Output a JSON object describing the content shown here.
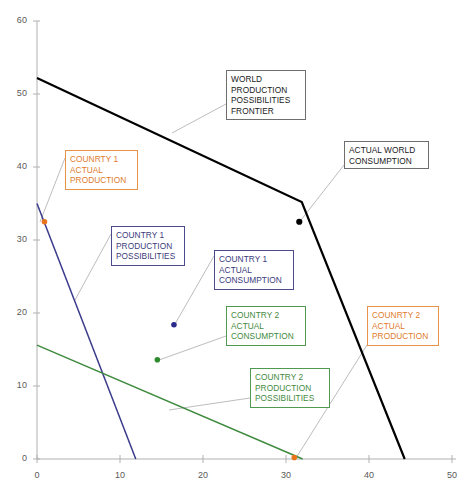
{
  "chart_data": {
    "type": "line",
    "title": "",
    "xlabel": "",
    "ylabel": "",
    "xlim": [
      0,
      50
    ],
    "ylim": [
      0,
      60
    ],
    "xticks": [
      0,
      10,
      20,
      30,
      40,
      50
    ],
    "yticks": [
      0,
      10,
      20,
      30,
      40,
      50,
      60
    ],
    "grid": false,
    "legend": "none (in-plot annotation boxes with leader lines)",
    "series": [
      {
        "name": "WORLD PRODUCTION POSSIBILITIES FRONTIER",
        "type": "line",
        "color": "#000000",
        "width": 2.2,
        "points": [
          [
            0,
            52.2
          ],
          [
            31.9,
            35.2
          ],
          [
            44.3,
            0
          ]
        ]
      },
      {
        "name": "COUNTRY 1 PRODUCTION POSSIBILITIES",
        "type": "line",
        "color": "#3b3b8c",
        "width": 1.5,
        "points": [
          [
            0,
            35.0
          ],
          [
            11.9,
            0
          ]
        ]
      },
      {
        "name": "COUNTRY 2 PRODUCTION POSSIBILITIES",
        "type": "line",
        "color": "#3f8a3f",
        "width": 1.5,
        "points": [
          [
            0,
            15.6
          ],
          [
            32.0,
            0
          ]
        ]
      }
    ],
    "points": [
      {
        "name": "ACTUAL WORLD CONSUMPTION",
        "x": 31.6,
        "y": 32.5,
        "color": "#000000",
        "r": 3.1
      },
      {
        "name": "COUNRTY 1 ACTUAL PRODUCTION",
        "x": 0.9,
        "y": 32.5,
        "color": "#e8751a",
        "r": 2.8
      },
      {
        "name": "COUNTRY 1 ACTUAL CONSUMPTION",
        "x": 16.5,
        "y": 18.4,
        "color": "#2b2b8f",
        "r": 2.8
      },
      {
        "name": "COUNTRY 2 ACTUAL CONSUMPTION",
        "x": 14.5,
        "y": 13.6,
        "color": "#2e8b2e",
        "r": 2.8
      },
      {
        "name": "COUNRTY 2 ACTUAL PRODUCTION",
        "x": 31.0,
        "y": 0.2,
        "color": "#e8751a",
        "r": 2.8
      }
    ],
    "annotations": [
      {
        "id": "world-ppf",
        "text": "WORLD\nPRODUCTION\nPOSSIBILITIES\nFRONTIER",
        "style": "black",
        "box_px": {
          "left": 226,
          "top": 70,
          "width": 80,
          "height": 50
        },
        "leader_px": [
          [
            226,
            104
          ],
          [
            172,
            133
          ]
        ]
      },
      {
        "id": "actual-world-consumption",
        "text": "ACTUAL WORLD\nCONSUMPTION",
        "style": "black",
        "box_px": {
          "left": 344,
          "top": 141,
          "width": 85,
          "height": 28
        },
        "leader_px": [
          [
            344,
            165
          ],
          [
            301,
            220
          ]
        ]
      },
      {
        "id": "country1-actual-production",
        "text": "COUNRTY 1\nACTUAL\nPRODUCTION",
        "style": "orange",
        "box_px": {
          "left": 65,
          "top": 150,
          "width": 73,
          "height": 40
        },
        "leader_px": [
          [
            65,
            158
          ],
          [
            40,
            222
          ]
        ]
      },
      {
        "id": "country1-production-possibilities",
        "text": "COUNTRY 1\nPRODUCTION\nPOSSIBILITIES",
        "style": "blue",
        "box_px": {
          "left": 111,
          "top": 226,
          "width": 74,
          "height": 40
        },
        "leader_px": [
          [
            111,
            234
          ],
          [
            75,
            300
          ]
        ]
      },
      {
        "id": "country1-actual-consumption",
        "text": "COUNTRY 1\nACTUAL\nCONSUMPTION",
        "style": "blue",
        "box_px": {
          "left": 214,
          "top": 250,
          "width": 80,
          "height": 40
        },
        "leader_px": [
          [
            214,
            256
          ],
          [
            175,
            324
          ]
        ]
      },
      {
        "id": "country2-actual-consumption",
        "text": "COUNTRY 2\nACTUAL\nCONSUMPTION",
        "style": "green",
        "box_px": {
          "left": 226,
          "top": 306,
          "width": 80,
          "height": 40
        },
        "leader_px": [
          [
            226,
            336
          ],
          [
            159,
            360
          ]
        ]
      },
      {
        "id": "country2-actual-production",
        "text": "COUNRTY 2\nACTUAL\nPRODUCTION",
        "style": "orange",
        "box_px": {
          "left": 367,
          "top": 306,
          "width": 72,
          "height": 40
        },
        "leader_px": [
          [
            367,
            345
          ],
          [
            296,
            458
          ]
        ]
      },
      {
        "id": "country2-production-possibilities",
        "text": "COUNTRY 2\nPRODUCTION\nPOSSIBILITIES",
        "style": "green",
        "box_px": {
          "left": 250,
          "top": 368,
          "width": 80,
          "height": 40
        },
        "leader_px": [
          [
            250,
            398
          ],
          [
            169,
            410
          ]
        ]
      }
    ]
  },
  "axes": {
    "x_tick_labels": [
      "0",
      "10",
      "20",
      "30",
      "40",
      "50"
    ],
    "y_tick_labels": [
      "0",
      "10",
      "20",
      "30",
      "40",
      "50",
      "60"
    ]
  }
}
